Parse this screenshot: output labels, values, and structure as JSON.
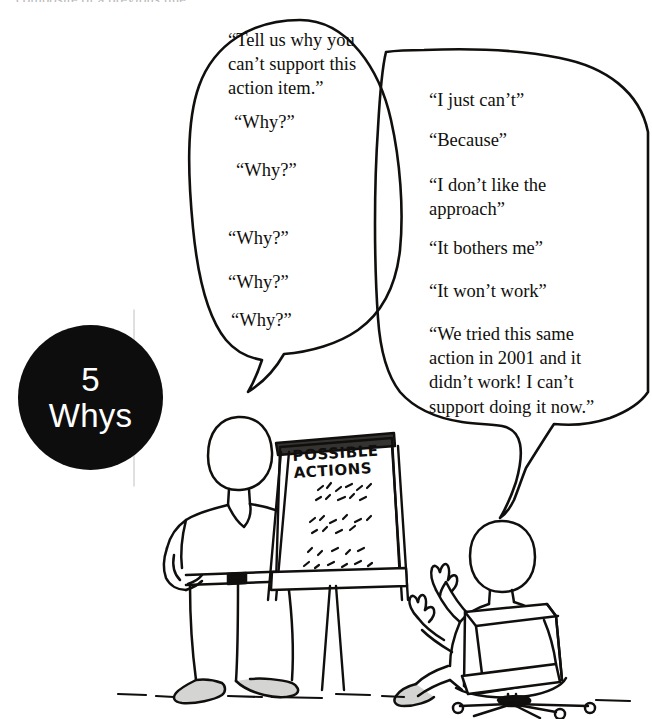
{
  "scene": {
    "caption_badge": {
      "number": "5",
      "word": "Whys",
      "bg_color": "#0d0d0d",
      "text_color": "#ffffff"
    },
    "top_cut_text": "composite of a previous line",
    "ground_label": "ground-line"
  },
  "facilitator_bubble": {
    "name": "facilitator-speech-bubble",
    "opening": "“Tell us why you can’t support this action item.”",
    "why_prompts": [
      {
        "text": "“Why?”",
        "x": 234,
        "y": 112
      },
      {
        "text": "“Why?”",
        "x": 236,
        "y": 160
      },
      {
        "text": "“Why?”",
        "x": 228,
        "y": 228
      },
      {
        "text": "“Why?”",
        "x": 228,
        "y": 272
      },
      {
        "text": "“Why?”",
        "x": 231,
        "y": 310
      }
    ]
  },
  "objector_bubble": {
    "name": "objector-speech-bubble",
    "answers": [
      {
        "text": "“I just can’t”",
        "x": 429,
        "y": 88,
        "width": 200
      },
      {
        "text": "“Because”",
        "x": 429,
        "y": 128,
        "width": 200
      },
      {
        "text": "“I don’t like the approach”",
        "x": 429,
        "y": 173,
        "width": 152
      },
      {
        "text": "“It bothers me”",
        "x": 429,
        "y": 236,
        "width": 200
      },
      {
        "text": "“It won’t work”",
        "x": 429,
        "y": 279,
        "width": 200
      },
      {
        "text": "“We tried this same action in 2001 and it didn’t work! I can’t support doing it now.”",
        "x": 429,
        "y": 322,
        "width": 176
      }
    ]
  },
  "flipchart": {
    "name": "flipchart-easel",
    "heading_line1": "POSSIBLE",
    "heading_line2": "ACTIONS",
    "body_note": "scribbled bullet list"
  },
  "figures": [
    {
      "name": "standing-facilitator",
      "pose": "hand on hip, pointing at flipchart"
    },
    {
      "name": "seated-objector",
      "pose": "seated in office chair, both hands raised"
    }
  ],
  "colors": {
    "ink": "#100f0d",
    "paper": "#ffffff",
    "badge": "#0d0d0d"
  }
}
